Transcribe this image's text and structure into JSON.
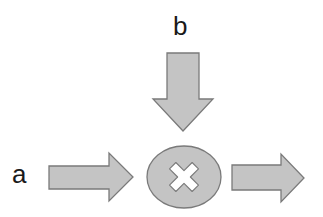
{
  "diagram": {
    "type": "multiplication-node",
    "labels": {
      "input_a": "a",
      "input_b": "b"
    },
    "node": {
      "operation": "multiply",
      "symbol": "×",
      "icon": "cross-icon"
    },
    "arrows": [
      {
        "name": "input-a-arrow",
        "direction": "right",
        "from": "a",
        "to": "node"
      },
      {
        "name": "input-b-arrow",
        "direction": "down",
        "from": "b",
        "to": "node"
      },
      {
        "name": "output-arrow",
        "direction": "right",
        "from": "node",
        "to": "output"
      }
    ],
    "colors": {
      "fill": "#c4c4c4",
      "stroke": "#7a7a7a",
      "cross": "#ffffff",
      "text": "#1a1a1a",
      "background": "#ffffff"
    }
  }
}
